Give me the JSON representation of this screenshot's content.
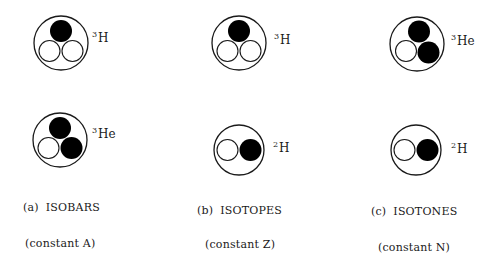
{
  "colors": {
    "proton": "#000000",
    "neutron": "#ffffff",
    "stroke": "#1a1a1a",
    "background": "#ffffff"
  },
  "legend_semantics": {
    "filled_circle": "proton",
    "open_circle": "neutron"
  },
  "panels": [
    {
      "tag": "(a)",
      "title": "ISOBARS",
      "subtitle": "(constant A)",
      "nuclei": [
        {
          "mass": "3",
          "symbol": "H",
          "protons": 1,
          "neutrons": 2
        },
        {
          "mass": "3",
          "symbol": "He",
          "protons": 2,
          "neutrons": 1
        }
      ]
    },
    {
      "tag": "(b)",
      "title": "ISOTOPES",
      "subtitle": "(constant Z)",
      "nuclei": [
        {
          "mass": "3",
          "symbol": "H",
          "protons": 1,
          "neutrons": 2
        },
        {
          "mass": "2",
          "symbol": "H",
          "protons": 1,
          "neutrons": 1
        }
      ]
    },
    {
      "tag": "(c)",
      "title": "ISOTONES",
      "subtitle": "(constant N)",
      "nuclei": [
        {
          "mass": "3",
          "symbol": "He",
          "protons": 2,
          "neutrons": 1
        },
        {
          "mass": "2",
          "symbol": "H",
          "protons": 1,
          "neutrons": 1
        }
      ]
    }
  ]
}
